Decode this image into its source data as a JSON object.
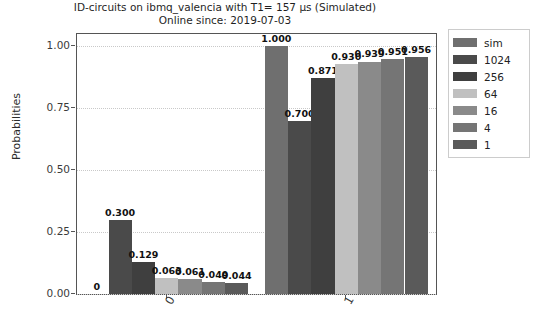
{
  "chart_data": {
    "type": "bar",
    "title": "ID-circuits on ibmq_valencia with T1= 157 µs (Simulated)",
    "subtitle": "Online since: 2019-07-03",
    "title_lines": [
      "ID-circuits on ibmq_valencia with T1= 157 µs (Simulated)",
      "Online since: 2019-07-03"
    ],
    "xlabel": "",
    "ylabel": "Probabilities",
    "categories": [
      "0",
      "1"
    ],
    "ylim": [
      0.0,
      1.05
    ],
    "yticks": [
      0.0,
      0.25,
      0.5,
      0.75,
      1.0
    ],
    "ytick_labels": [
      "0.00",
      "0.25",
      "0.50",
      "0.75",
      "1.00"
    ],
    "grid": true,
    "grid_axis": "y",
    "legend_position": "right-outside",
    "legend_title": "",
    "series": [
      {
        "name": "sim",
        "color": "#6f6f6f",
        "values": [
          0.0,
          1.0
        ],
        "labels": [
          "0",
          "1.000"
        ]
      },
      {
        "name": "1024",
        "color": "#4a4a4a",
        "values": [
          0.3,
          0.7
        ],
        "labels": [
          "0.300",
          "0.700"
        ]
      },
      {
        "name": "256",
        "color": "#3f3f3f",
        "values": [
          0.129,
          0.871
        ],
        "labels": [
          "0.129",
          "0.871"
        ]
      },
      {
        "name": "64",
        "color": "#c0c0c0",
        "values": [
          0.063,
          0.93
        ],
        "labels": [
          "0.063",
          "0.930"
        ]
      },
      {
        "name": "16",
        "color": "#8a8a8a",
        "values": [
          0.061,
          0.939
        ],
        "labels": [
          "0.061",
          "0.939"
        ]
      },
      {
        "name": "4",
        "color": "#757575",
        "values": [
          0.049,
          0.951
        ],
        "labels": [
          "0.049",
          "0.951"
        ]
      },
      {
        "name": "1",
        "color": "#5a5a5a",
        "values": [
          0.044,
          0.956
        ],
        "labels": [
          "0.044",
          "0.956"
        ]
      }
    ]
  }
}
